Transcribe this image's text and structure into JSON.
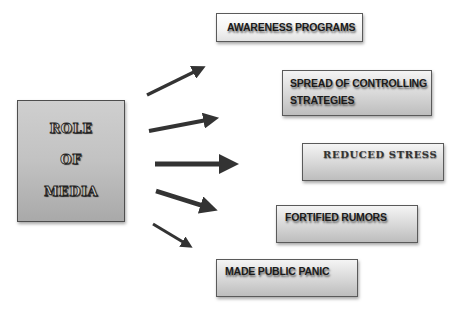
{
  "diagram": {
    "center": {
      "lines": [
        "ROLE",
        "OF",
        "MEDIA"
      ]
    },
    "outcomes": [
      {
        "id": "awareness",
        "label": "AWARENESS PROGRAMS"
      },
      {
        "id": "spread",
        "label_line1": "SPREAD OF CONTROLLING",
        "label_line2": "STRATEGIES"
      },
      {
        "id": "reduced-stress",
        "label": "REDUCED STRESS"
      },
      {
        "id": "fortified-rumors",
        "label": "FORTIFIED RUMORS"
      },
      {
        "id": "public-panic",
        "label": "MADE PUBLIC PANIC"
      }
    ],
    "arrow_color": "#3a3a3a",
    "box_border_color": "#5a5a5a"
  }
}
